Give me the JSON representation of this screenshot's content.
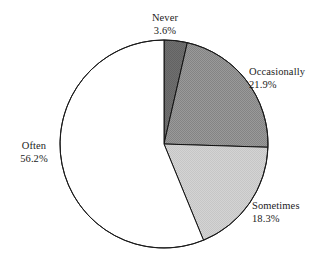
{
  "chart_data": {
    "type": "pie",
    "title": "",
    "subtitle": "",
    "xlabel": "",
    "ylabel": "",
    "legend_position": "none",
    "grid": false,
    "units": "percent",
    "start_angle_deg": 0,
    "direction": "clockwise",
    "categories": [
      "Never",
      "Occasionally",
      "Sometimes",
      "Often"
    ],
    "values": [
      3.6,
      21.9,
      18.3,
      56.2
    ],
    "slices": [
      {
        "label": "Never",
        "value": 3.6,
        "value_text": "3.6%",
        "color": "#6a6a6a",
        "stroke": "#111111"
      },
      {
        "label": "Occasionally",
        "value": 21.9,
        "value_text": "21.9%",
        "color": "#8e8e8e",
        "stroke": "#111111"
      },
      {
        "label": "Sometimes",
        "value": 18.3,
        "value_text": "18.3%",
        "color": "#cdcdcd",
        "stroke": "#111111"
      },
      {
        "label": "Often",
        "value": 56.2,
        "value_text": "56.2%",
        "color": "#ffffff",
        "stroke": "#111111"
      }
    ]
  },
  "labels": {
    "never": {
      "name": "Never",
      "pct": "3.6%"
    },
    "occasionally": {
      "name": "Occasionally",
      "pct": "21.9%"
    },
    "sometimes": {
      "name": "Sometimes",
      "pct": "18.3%"
    },
    "often": {
      "name": "Often",
      "pct": "56.2%"
    }
  }
}
